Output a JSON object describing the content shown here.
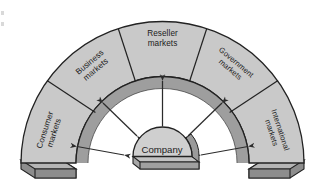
{
  "diagram": {
    "type": "arch-radial",
    "background_color": "#ffffff",
    "center_node": {
      "label": "Company",
      "shape": "3d-dome",
      "face_color": "#cfcfcf",
      "base_color": "#a8a8a8",
      "outline_color": "#222222"
    },
    "arch": {
      "outer_band_color": "#c9c9c9",
      "inner_band_color": "#9e9e9e",
      "endcap_top_color": "#b5b5b5",
      "endcap_front_color": "#8d8d8d",
      "outline_color": "#222222",
      "span_degrees": 180
    },
    "segments": [
      {
        "id": "consumer",
        "label_line1": "Consumer",
        "label_line2": "markets",
        "angle_deg": -72,
        "text_rotation_deg": -72
      },
      {
        "id": "business",
        "label_line1": "Business",
        "label_line2": "markets",
        "angle_deg": -40,
        "text_rotation_deg": -40
      },
      {
        "id": "reseller",
        "label_line1": "Reseller",
        "label_line2": "markets",
        "angle_deg": 0,
        "text_rotation_deg": 0
      },
      {
        "id": "government",
        "label_line1": "Government",
        "label_line2": "markets",
        "angle_deg": 40,
        "text_rotation_deg": 40
      },
      {
        "id": "international",
        "label_line1": "International",
        "label_line2": "markets",
        "angle_deg": 72,
        "text_rotation_deg": 72
      }
    ],
    "connectors": [
      {
        "id": "arrow-consumer",
        "target": "consumer",
        "style": "double-headed",
        "color": "#2b2b2b"
      },
      {
        "id": "arrow-business",
        "target": "business",
        "style": "double-headed",
        "color": "#2b2b2b"
      },
      {
        "id": "arrow-reseller",
        "target": "reseller",
        "style": "double-headed",
        "color": "#2b2b2b"
      },
      {
        "id": "arrow-government",
        "target": "government",
        "style": "double-headed",
        "color": "#2b2b2b"
      },
      {
        "id": "arrow-international",
        "target": "international",
        "style": "double-headed",
        "color": "#2b2b2b"
      }
    ]
  }
}
